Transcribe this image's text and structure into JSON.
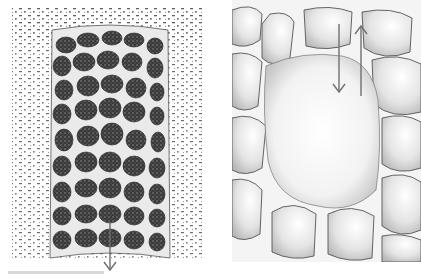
{
  "figure": {
    "panels": [
      {
        "id": "left",
        "description": "Stippled illustration of a cylindrical column of honeycomb-like polygonal cells embedded in speckled surrounding tissue",
        "arrows": [
          {
            "direction": "down",
            "label": ""
          }
        ]
      },
      {
        "id": "right",
        "description": "Close-up stippled drawing of rounded cells separated by light membranes with central pale region",
        "arrows": [
          {
            "direction": "down",
            "label": ""
          },
          {
            "direction": "up",
            "label": ""
          }
        ]
      }
    ],
    "colors": {
      "ink": "#2a2a2a",
      "arrow": "#707070",
      "stipple": "#9a9a9a",
      "paper": "#ffffff"
    }
  }
}
